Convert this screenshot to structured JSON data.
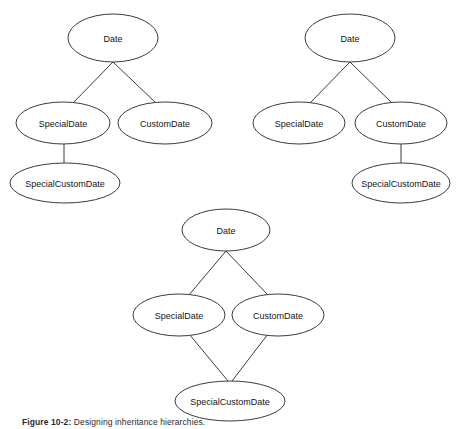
{
  "figure": {
    "domain": "Diagram",
    "background_color": "#ffffff",
    "stroke_color": "#3b3b3b",
    "text_color": "#141414",
    "width": 456,
    "height": 429,
    "caption_prefix": "Figure 10-2:",
    "caption_text": "Designing inheritance hierarchies."
  },
  "diagrams": [
    {
      "id": "diagram-left",
      "name": "single-inheritance-via-specialdate",
      "nodes": [
        {
          "id": "d1-date",
          "label": "Date",
          "cx": 113,
          "cy": 38,
          "rx": 45,
          "ry": 24,
          "font_size": 9
        },
        {
          "id": "d1-special",
          "label": "SpecialDate",
          "cx": 63,
          "cy": 123,
          "rx": 47,
          "ry": 21,
          "font_size": 9
        },
        {
          "id": "d1-custom",
          "label": "CustomDate",
          "cx": 165,
          "cy": 123,
          "rx": 47,
          "ry": 21,
          "font_size": 9
        },
        {
          "id": "d1-scd",
          "label": "SpecialCustomDate",
          "cx": 65,
          "cy": 183,
          "rx": 55,
          "ry": 20,
          "font_size": 9
        }
      ],
      "edges": [
        {
          "from": "d1-date",
          "to": "d1-special",
          "x1": 113,
          "y1": 62,
          "x2": 73,
          "y2": 103
        },
        {
          "from": "d1-date",
          "to": "d1-custom",
          "x1": 113,
          "y1": 62,
          "x2": 156,
          "y2": 103
        },
        {
          "from": "d1-special",
          "to": "d1-scd",
          "x1": 64,
          "y1": 144,
          "x2": 64,
          "y2": 163
        }
      ]
    },
    {
      "id": "diagram-right",
      "name": "single-inheritance-via-customdate",
      "nodes": [
        {
          "id": "d2-date",
          "label": "Date",
          "cx": 350,
          "cy": 38,
          "rx": 45,
          "ry": 24,
          "font_size": 9
        },
        {
          "id": "d2-special",
          "label": "SpecialDate",
          "cx": 299,
          "cy": 123,
          "rx": 46,
          "ry": 21,
          "font_size": 9
        },
        {
          "id": "d2-custom",
          "label": "CustomDate",
          "cx": 401,
          "cy": 123,
          "rx": 46,
          "ry": 21,
          "font_size": 9
        },
        {
          "id": "d2-scd",
          "label": "SpecialCustomDate",
          "cx": 401,
          "cy": 183,
          "rx": 49,
          "ry": 20,
          "font_size": 9
        }
      ],
      "edges": [
        {
          "from": "d2-date",
          "to": "d2-special",
          "x1": 350,
          "y1": 62,
          "x2": 310,
          "y2": 103
        },
        {
          "from": "d2-date",
          "to": "d2-custom",
          "x1": 350,
          "y1": 62,
          "x2": 392,
          "y2": 103
        },
        {
          "from": "d2-custom",
          "to": "d2-scd",
          "x1": 401,
          "y1": 144,
          "x2": 401,
          "y2": 163
        }
      ]
    },
    {
      "id": "diagram-bottom",
      "name": "multiple-inheritance-diamond",
      "nodes": [
        {
          "id": "d3-date",
          "label": "Date",
          "cx": 226,
          "cy": 230,
          "rx": 44,
          "ry": 21,
          "font_size": 9
        },
        {
          "id": "d3-special",
          "label": "SpecialDate",
          "cx": 179,
          "cy": 315,
          "rx": 46,
          "ry": 21,
          "font_size": 9
        },
        {
          "id": "d3-custom",
          "label": "CustomDate",
          "cx": 278,
          "cy": 315,
          "rx": 46,
          "ry": 21,
          "font_size": 9
        },
        {
          "id": "d3-scd",
          "label": "SpecialCustomDate",
          "cx": 230,
          "cy": 401,
          "rx": 55,
          "ry": 20,
          "font_size": 9
        }
      ],
      "edges": [
        {
          "from": "d3-date",
          "to": "d3-special",
          "x1": 226,
          "y1": 251,
          "x2": 189,
          "y2": 295
        },
        {
          "from": "d3-date",
          "to": "d3-custom",
          "x1": 226,
          "y1": 251,
          "x2": 268,
          "y2": 295
        },
        {
          "from": "d3-special",
          "to": "d3-scd",
          "x1": 189,
          "y1": 334,
          "x2": 228,
          "y2": 381
        },
        {
          "from": "d3-custom",
          "to": "d3-scd",
          "x1": 268,
          "y1": 334,
          "x2": 232,
          "y2": 381
        }
      ]
    }
  ]
}
